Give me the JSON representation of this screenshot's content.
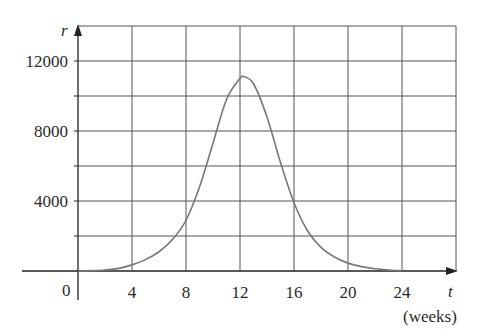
{
  "chart_data": {
    "type": "line",
    "title": "",
    "xlabel": "t",
    "xlabel_unit": "(weeks)",
    "ylabel": "r",
    "x_ticks": [
      4,
      8,
      12,
      16,
      20,
      24
    ],
    "y_ticks": [
      4000,
      8000,
      12000
    ],
    "origin_label": "0",
    "xlim": [
      0,
      28
    ],
    "ylim": [
      0,
      14000
    ],
    "grid": true,
    "x_grid_step": 4,
    "y_grid_step": 2000,
    "legend": null,
    "series": [
      {
        "name": "r(t)",
        "x": [
          0,
          1,
          2,
          3,
          4,
          5,
          6,
          7,
          8,
          9,
          10,
          11,
          12,
          12.3,
          13,
          14,
          15,
          16,
          17,
          18,
          19,
          20,
          21,
          22,
          23,
          24
        ],
        "y": [
          0,
          20,
          60,
          150,
          350,
          650,
          1100,
          1800,
          2900,
          4800,
          7300,
          9800,
          11000,
          11100,
          10700,
          8800,
          6200,
          3900,
          2300,
          1350,
          800,
          450,
          250,
          130,
          60,
          20
        ]
      }
    ],
    "colors": {
      "curve": "#777777",
      "grid": "#555555",
      "axes": "#222222",
      "text": "#2a2a2a"
    }
  }
}
